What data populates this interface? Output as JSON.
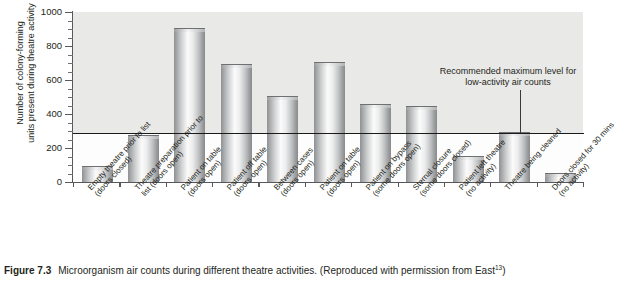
{
  "figure": {
    "caption_label": "Figure 7.3",
    "caption_text": "Microorganism air counts during different theatre activities. (Reproduced with permission from East",
    "caption_reference": "13",
    "caption_tail": ")"
  },
  "annotation": {
    "text": "Recommended maximum level\nfor low-activity air counts"
  },
  "chart_data": {
    "type": "bar",
    "title": "",
    "xlabel": "",
    "ylabel": "Number of colony-forming\nunits present during theatre activity",
    "ylim": [
      0,
      1000
    ],
    "ytick_step": 200,
    "yminor_step": 50,
    "grid": false,
    "legend": "none",
    "reference_line": {
      "value": 290,
      "label": "Recommended maximum level for low-activity air counts"
    },
    "ytick_labels": [
      "0",
      "200",
      "400",
      "600",
      "800",
      "1000"
    ],
    "ytick_values": [
      0,
      200,
      400,
      600,
      800,
      1000
    ],
    "categories": [
      "Empty theatre prior to list\n(doors closed)",
      "Theatre preparation prior to\nlist (doors open)",
      "Patient on table\n(doors open)",
      "Patient off table\n(doors open)",
      "Between cases\n(doors open)",
      "Patient on table\n(doors open)",
      "Patient on bypass\n(some doors open)",
      "Sternal closure\n(some doors closed)",
      "Patient left theatre\n(no activity)",
      "Theatre being cleaned",
      "Doors closed for 30 mins\n(no activity)"
    ],
    "values": [
      90,
      270,
      900,
      690,
      500,
      700,
      455,
      440,
      145,
      290,
      50
    ]
  }
}
